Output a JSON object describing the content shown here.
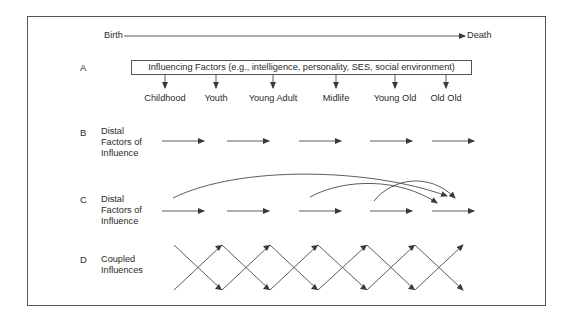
{
  "timeline": {
    "start_label": "Birth",
    "end_label": "Death"
  },
  "panels": {
    "A": {
      "letter": "A",
      "box_label": "Influencing Factors (e.g., intelligence, personality, SES, social environment)",
      "stages": [
        "Childhood",
        "Youth",
        "Young Adult",
        "Midlife",
        "Young Old",
        "Old Old"
      ]
    },
    "B": {
      "letter": "B",
      "label_lines": [
        "Distal",
        "Factors of",
        "Influence"
      ]
    },
    "C": {
      "letter": "C",
      "label_lines": [
        "Distal",
        "Factors of",
        "Influence"
      ]
    },
    "D": {
      "letter": "D",
      "label_lines": [
        "Coupled",
        "Influences"
      ]
    }
  },
  "colors": {
    "line": "#4a4a4a",
    "text": "#2a2a2a",
    "border": "#555555"
  }
}
